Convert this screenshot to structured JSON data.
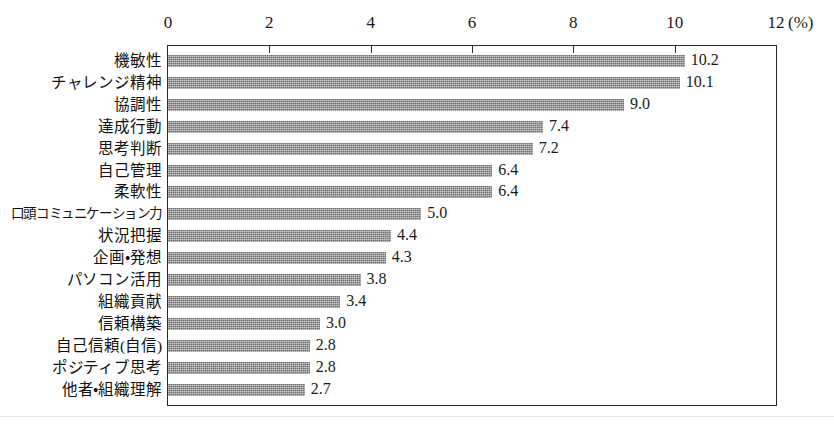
{
  "chart_data": {
    "type": "bar",
    "orientation": "horizontal",
    "title": "",
    "xlabel": "(%)",
    "ylabel": "",
    "xlim": [
      0,
      12
    ],
    "grid": false,
    "legend": null,
    "unit": "(%)",
    "xticks": [
      "0",
      "2",
      "4",
      "6",
      "8",
      "10",
      "12"
    ],
    "xtick_values": [
      0,
      2,
      4,
      6,
      8,
      10,
      12
    ],
    "categories": [
      "機敏性",
      "チャレンジ精神",
      "協調性",
      "達成行動",
      "思考判断",
      "自己管理",
      "柔軟性",
      "口頭コミュニケーション力",
      "状況把握",
      "企画・発想",
      "パソコン活用",
      "組織貢献",
      "信頼構築",
      "自己信頼(自信)",
      "ポジティブ思考",
      "他者・組織理解"
    ],
    "values": [
      10.2,
      10.1,
      9.0,
      7.4,
      7.2,
      6.4,
      6.4,
      5.0,
      4.4,
      4.3,
      3.8,
      3.4,
      3.0,
      2.8,
      2.8,
      2.7
    ],
    "value_labels": [
      "10.2",
      "10.1",
      "9.0",
      "7.4",
      "7.2",
      "6.4",
      "6.4",
      "5.0",
      "4.4",
      "4.3",
      "3.8",
      "3.4",
      "3.0",
      "2.8",
      "2.8",
      "2.7"
    ],
    "bar_color": "#909090",
    "frame_color": "#2b2b2b",
    "background_color": "#ffffff"
  }
}
